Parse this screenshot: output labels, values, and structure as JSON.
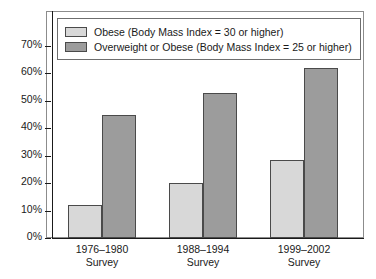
{
  "chart_data": {
    "type": "bar",
    "title": "",
    "xlabel": "",
    "ylabel": "",
    "ylim": [
      0,
      75
    ],
    "grid": false,
    "legend_position": "top-left",
    "categories": [
      "1976–1980\nSurvey",
      "1988–1994\nSurvey",
      "1999–2002\nSurvey"
    ],
    "category_lines": [
      {
        "line1": "1976–1980",
        "line2": "Survey"
      },
      {
        "line1": "1988–1994",
        "line2": "Survey"
      },
      {
        "line1": "1999–2002",
        "line2": "Survey"
      }
    ],
    "series": [
      {
        "name": "Obese (Body Mass Index = 30 or higher)",
        "color": "#d8d8d8",
        "values": [
          12,
          20,
          28.5
        ]
      },
      {
        "name": "Overweight or Obese (Body Mass Index = 25 or higher)",
        "color": "#9c9c9c",
        "values": [
          45,
          53,
          62
        ]
      }
    ],
    "y_ticks": [
      {
        "value": 0,
        "label": "0%"
      },
      {
        "value": 10,
        "label": "10%"
      },
      {
        "value": 20,
        "label": "20%"
      },
      {
        "value": 30,
        "label": "30%"
      },
      {
        "value": 40,
        "label": "40%"
      },
      {
        "value": 50,
        "label": "50%"
      },
      {
        "value": 60,
        "label": "60%"
      },
      {
        "value": 70,
        "label": "70%"
      }
    ]
  },
  "legend": {
    "items": [
      {
        "label": "Obese (Body Mass Index = 30 or higher)"
      },
      {
        "label": "Overweight or Obese (Body Mass Index = 25 or higher)"
      }
    ]
  }
}
